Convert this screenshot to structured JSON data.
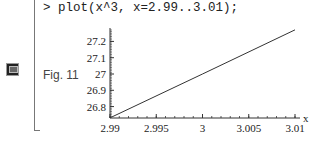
{
  "worksheet": {
    "prompt_command": "> plot(x^3, x=2.99..3.01);",
    "figure_label": "Fig. 11",
    "side_icon": "terminal-icon"
  },
  "chart_data": {
    "type": "line",
    "title": "",
    "xlabel": "x",
    "ylabel": "",
    "function": "x^3",
    "xlim": [
      2.99,
      3.01
    ],
    "ylim": [
      26.73,
      27.27
    ],
    "x_ticks": [
      2.99,
      2.995,
      3,
      3.005,
      3.01
    ],
    "x_tick_labels": [
      "2.99",
      "2.995",
      "3",
      "3.005",
      "3.01"
    ],
    "y_ticks": [
      26.8,
      26.9,
      27,
      27.1,
      27.2
    ],
    "y_tick_labels": [
      "26.8",
      "26.9",
      "27",
      "27.1",
      "27.2"
    ],
    "series": [
      {
        "name": "x^3",
        "x": [
          2.99,
          3.0,
          3.01
        ],
        "y": [
          26.7309,
          27.0,
          27.2709
        ]
      }
    ],
    "grid": false,
    "color": "#333333"
  }
}
